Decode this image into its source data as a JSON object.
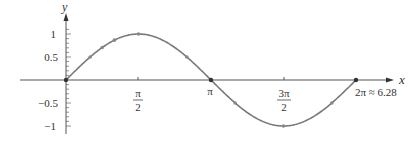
{
  "chart_data": {
    "type": "line",
    "title": "",
    "xlabel": "x",
    "ylabel": "y",
    "function": "sin(x)",
    "xlim": [
      -1.0,
      7.0
    ],
    "ylim": [
      -1.2,
      1.3
    ],
    "grid": false,
    "legend": null,
    "x_ticks": [
      {
        "value": 1.5708,
        "label_num": "π",
        "label_den": "2"
      },
      {
        "value": 3.1416,
        "label": "π"
      },
      {
        "value": 4.7124,
        "label_num": "3π",
        "label_den": "2"
      },
      {
        "value": 6.2832,
        "label": "2π ≈ 6.28"
      }
    ],
    "y_ticks": [
      {
        "value": 1,
        "label": "1"
      },
      {
        "value": 0.5,
        "label": "0.5"
      },
      {
        "value": -0.5,
        "label": "−0.5"
      },
      {
        "value": -1,
        "label": "−1"
      }
    ],
    "series": [
      {
        "name": "sin x",
        "color": "#7a7a7a",
        "x": [
          0,
          0.5236,
          0.7854,
          1.0472,
          1.5708,
          2.618,
          3.1416,
          3.6652,
          4.7124,
          5.7596,
          6.2832
        ],
        "values": [
          0,
          0.5,
          0.7071,
          0.866,
          1,
          0.5,
          0,
          -0.5,
          -1,
          -0.5,
          0
        ],
        "markers": true
      }
    ]
  },
  "labels": {
    "x_axis": "x",
    "y_axis": "y",
    "y1": "1",
    "y05": "0.5",
    "ym05": "−0.5",
    "ym1": "−1",
    "pi_half_num": "π",
    "pi_half_den": "2",
    "pi": "π",
    "three_pi_half_num": "3π",
    "three_pi_half_den": "2",
    "two_pi": "2π ≈ 6.28"
  }
}
